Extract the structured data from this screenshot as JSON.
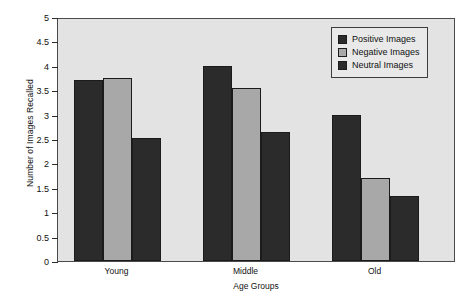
{
  "chart_data": {
    "type": "bar",
    "title": "",
    "xlabel": "Age Groups",
    "ylabel": "Number of Images Recalled",
    "categories": [
      "Young",
      "Middle",
      "Old"
    ],
    "series": [
      {
        "name": "Positive Images",
        "color": "#2b2b2b",
        "values": [
          3.7,
          4.0,
          3.0
        ]
      },
      {
        "name": "Negative Images",
        "color": "#a8a8a8",
        "values": [
          3.76,
          3.55,
          1.7
        ]
      },
      {
        "name": "Neutral Images",
        "color": "#2b2b2b",
        "values": [
          2.52,
          2.65,
          1.33
        ]
      }
    ],
    "ylim": [
      0,
      5
    ],
    "yticks": [
      "0",
      "0.5",
      "1",
      "1.5",
      "2",
      "2.5",
      "3",
      "3.5",
      "4",
      "4.5",
      "5"
    ],
    "ytick_values": [
      0,
      0.5,
      1,
      1.5,
      2,
      2.5,
      3,
      3.5,
      4,
      4.5,
      5
    ],
    "grid": false,
    "legend_position": "top-right",
    "plot_background": "#e3e3e3",
    "page_background": "#ffffff"
  }
}
